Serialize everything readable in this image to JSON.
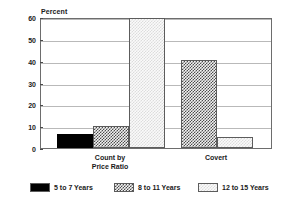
{
  "chart_data": {
    "type": "bar",
    "title": "",
    "subtitle": "",
    "xlabel": "",
    "ylabel": "Percent",
    "ylim": [
      0,
      60
    ],
    "yticks": [
      0,
      10,
      20,
      30,
      40,
      50,
      60
    ],
    "ytick_labels": [
      "0",
      "10",
      "20",
      "30",
      "40",
      "50",
      "60"
    ],
    "grid": true,
    "legend_position": "bottom",
    "categories": [
      "Count by\nPrice Ratio",
      "Covert"
    ],
    "category_labels": [
      {
        "line1": "Count by",
        "line2": "Price Ratio"
      },
      {
        "line1": "Covert",
        "line2": ""
      }
    ],
    "series": [
      {
        "name": "5 to 7 Years",
        "pattern": "solid-black",
        "color": "#000000",
        "values": [
          6.5,
          0
        ]
      },
      {
        "name": "8 to 11 Years",
        "pattern": "checkerboard",
        "color": "#4c4c4c",
        "values": [
          10,
          40.5
        ]
      },
      {
        "name": "12 to 15 Years",
        "pattern": "light-dots",
        "color": "#dcdcdc",
        "values": [
          59.5,
          5.2
        ]
      }
    ]
  },
  "legend": {
    "items": [
      {
        "label": "5 to 7 Years"
      },
      {
        "label": "8 to 11 Years"
      },
      {
        "label": "12 to 15 Years"
      }
    ]
  },
  "colors": {
    "frame": "#6d6d6d",
    "grid": "#b9b9b9",
    "text": "#1a1a1a",
    "background": "#ffffff"
  }
}
